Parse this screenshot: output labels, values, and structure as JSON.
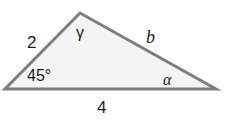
{
  "diagram": {
    "type": "triangle",
    "colors": {
      "fill": "#f4f4f4",
      "stroke": "#7d7d7d",
      "text": "#1a1a1a"
    },
    "vertices": {
      "apex": [
        80,
        13
      ],
      "left": [
        5,
        89
      ],
      "right": [
        216,
        89
      ]
    },
    "sides": {
      "left_side": "2",
      "right_side": "b",
      "base": "4"
    },
    "angles": {
      "left": "45°",
      "apex": "γ",
      "right": "α"
    }
  }
}
